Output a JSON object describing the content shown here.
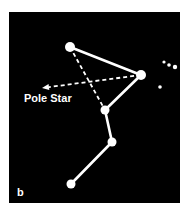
{
  "figure": {
    "panel_label": "b",
    "pointer_label": "Pole Star",
    "colors": {
      "background": "#000000",
      "stars": "#ffffff",
      "page": "#ffffff"
    },
    "stars": [
      {
        "id": "top",
        "x": 70,
        "y": 47,
        "r": 5
      },
      {
        "id": "right",
        "x": 141,
        "y": 75,
        "r": 5
      },
      {
        "id": "middle",
        "x": 105,
        "y": 110,
        "r": 4.5
      },
      {
        "id": "lower",
        "x": 112,
        "y": 142,
        "r": 4.5
      },
      {
        "id": "bottom",
        "x": 71,
        "y": 184,
        "r": 4.5
      }
    ],
    "small_stars": [
      {
        "x": 164,
        "y": 62,
        "r": 1.6
      },
      {
        "x": 169,
        "y": 65,
        "r": 1.8
      },
      {
        "x": 175,
        "y": 67,
        "r": 2.2
      },
      {
        "x": 160,
        "y": 87,
        "r": 1.8
      }
    ],
    "solid_lines": [
      [
        "top",
        "right"
      ],
      [
        "right",
        "middle"
      ],
      [
        "middle",
        "lower"
      ],
      [
        "lower",
        "bottom"
      ]
    ],
    "dashed_lines": [
      [
        "top",
        "middle"
      ]
    ],
    "pointer_arrow": {
      "from": [
        141,
        75
      ],
      "to": [
        42,
        88
      ]
    }
  }
}
